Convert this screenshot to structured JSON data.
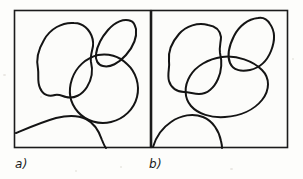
{
  "figure": {
    "background_color": "#fdfdfb",
    "ink_color": "#141414",
    "frame_color": "#1b1b1b",
    "width": 303,
    "height": 179,
    "panels": [
      {
        "id": "panel-a",
        "label": "a)",
        "frame": {
          "x": 14,
          "y": 10,
          "width": 137,
          "height": 138
        },
        "shapes": [
          {
            "name": "upper-left-blob",
            "type": "closed-contour"
          },
          {
            "name": "upper-right-ellipse",
            "type": "closed-contour"
          },
          {
            "name": "large-circle",
            "type": "closed-contour"
          },
          {
            "name": "bottom-arc",
            "type": "open-arc"
          }
        ]
      },
      {
        "id": "panel-b",
        "label": "b)",
        "frame": {
          "x": 151,
          "y": 10,
          "width": 137,
          "height": 138
        },
        "shapes": [
          {
            "name": "upper-left-blob",
            "type": "closed-contour"
          },
          {
            "name": "upper-right-blob",
            "type": "closed-contour"
          },
          {
            "name": "large-oval",
            "type": "closed-contour"
          },
          {
            "name": "bottom-arc",
            "type": "open-arc"
          }
        ]
      }
    ]
  }
}
